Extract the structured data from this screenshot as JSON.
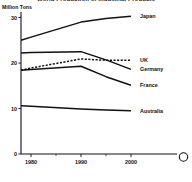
{
  "chart_data": {
    "type": "line",
    "title": "World Production of Industrial Products",
    "xlabel": "",
    "ylabel": "Million Tons",
    "x": [
      1978,
      1980,
      1990,
      1995,
      2000
    ],
    "xlim": [
      1978,
      2001
    ],
    "ylim": [
      0,
      31
    ],
    "xticks": [
      1980,
      1990,
      2000
    ],
    "xtick_labels": [
      "1980",
      "1990",
      "2000"
    ],
    "yticks": [
      0,
      10,
      20,
      30
    ],
    "ytick_labels": [
      "0",
      "10",
      "20",
      "30"
    ],
    "grid": false,
    "legend_position": "right-inline",
    "series": [
      {
        "name": "Japan",
        "label": "Japan",
        "style": "solid",
        "x": [
          1978,
          1980,
          1990,
          1995,
          2000
        ],
        "values": [
          25.0,
          25.7,
          29.0,
          29.8,
          30.3
        ]
      },
      {
        "name": "Germany",
        "label": "Germany",
        "style": "solid",
        "x": [
          1978,
          1980,
          1990,
          1995,
          2000
        ],
        "values": [
          22.2,
          22.3,
          22.5,
          20.7,
          18.6
        ]
      },
      {
        "name": "UK",
        "label": "UK",
        "style": "dashed",
        "x": [
          1978,
          1980,
          1990,
          1995,
          2000
        ],
        "values": [
          18.4,
          18.9,
          20.9,
          20.6,
          20.6
        ]
      },
      {
        "name": "France",
        "label": "France",
        "style": "solid",
        "x": [
          1978,
          1980,
          1990,
          1995,
          2000
        ],
        "values": [
          18.4,
          18.6,
          19.3,
          17.0,
          15.1
        ]
      },
      {
        "name": "Australia",
        "label": "Australia",
        "style": "solid",
        "x": [
          1978,
          1980,
          1990,
          1995,
          2000
        ],
        "values": [
          10.6,
          10.5,
          9.9,
          9.7,
          9.5
        ]
      }
    ]
  },
  "decoration": {
    "circle_marker": "circle-glyph"
  }
}
